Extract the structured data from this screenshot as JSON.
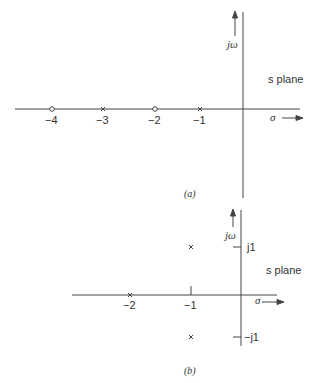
{
  "figure_a": {
    "caption": "(a)",
    "plane_label": "s plane",
    "imag_axis_label": "jω",
    "real_axis_label": "σ",
    "points": [
      {
        "type": "zero",
        "real": -4,
        "label": "−4"
      },
      {
        "type": "pole",
        "real": -3,
        "label": "−3"
      },
      {
        "type": "zero",
        "real": -2,
        "label": "−2"
      },
      {
        "type": "pole",
        "real": -1,
        "label": "−1"
      }
    ]
  },
  "figure_b": {
    "caption": "(b)",
    "plane_label": "s plane",
    "imag_axis_label": "jω",
    "real_axis_label": "σ",
    "imag_ticks": [
      {
        "value": 1,
        "label": "j1"
      },
      {
        "value": -1,
        "label": "−j1"
      }
    ],
    "real_ticks": [
      {
        "value": -2,
        "label": "−2"
      },
      {
        "value": -1,
        "label": "−1"
      }
    ],
    "points": [
      {
        "type": "pole",
        "real": -2,
        "imag": 0
      },
      {
        "type": "pole",
        "real": -1,
        "imag": 1
      },
      {
        "type": "pole",
        "real": -1,
        "imag": -1
      }
    ]
  }
}
